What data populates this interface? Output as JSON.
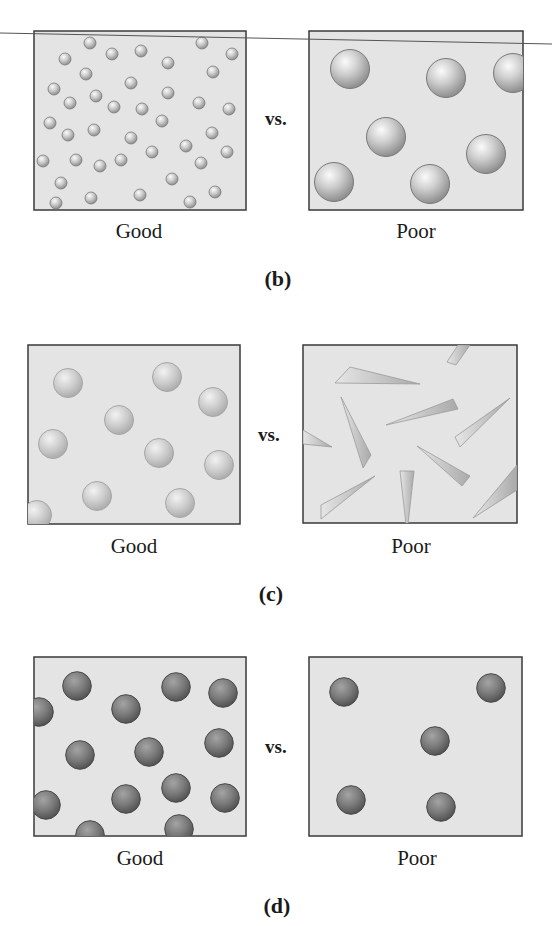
{
  "figure": {
    "colors": {
      "box_fill": "#e4e4e4",
      "box_border": "#3a3a3a",
      "text": "#1a1a1a",
      "line": "#555555"
    },
    "panels": [
      {
        "label": "(b)",
        "vs": "vs.",
        "good": {
          "caption": "Good",
          "particle": "small-sphere",
          "sphere_style": "mid",
          "radius": 6,
          "centers": [
            [
              90,
              43
            ],
            [
              202,
              43
            ],
            [
              65,
              59
            ],
            [
              112,
              54
            ],
            [
              141,
              51
            ],
            [
              232,
              54
            ],
            [
              168,
              63
            ],
            [
              86,
              74
            ],
            [
              213,
              72
            ],
            [
              131,
              83
            ],
            [
              54,
              89
            ],
            [
              168,
              93
            ],
            [
              96,
              96
            ],
            [
              70,
              103
            ],
            [
              114,
              107
            ],
            [
              142,
              109
            ],
            [
              199,
              103
            ],
            [
              229,
              109
            ],
            [
              50,
              123
            ],
            [
              162,
              121
            ],
            [
              68,
              135
            ],
            [
              94,
              130
            ],
            [
              131,
              138
            ],
            [
              212,
              133
            ],
            [
              186,
              146
            ],
            [
              152,
              152
            ],
            [
              227,
              152
            ],
            [
              43,
              161
            ],
            [
              76,
              160
            ],
            [
              100,
              166
            ],
            [
              121,
              160
            ],
            [
              201,
              163
            ],
            [
              61,
              183
            ],
            [
              172,
              179
            ],
            [
              91,
              198
            ],
            [
              140,
              195
            ],
            [
              215,
              192
            ],
            [
              56,
              203
            ],
            [
              190,
              202
            ]
          ]
        },
        "poor": {
          "caption": "Poor",
          "particle": "large-sphere",
          "sphere_style": "mid",
          "radius": 19.5,
          "centers": [
            [
              350,
              69
            ],
            [
              446,
              78
            ],
            [
              513,
              73
            ],
            [
              386,
              137
            ],
            [
              486,
              154
            ],
            [
              334,
              182
            ],
            [
              430,
              184
            ]
          ]
        }
      },
      {
        "label": "(c)",
        "vs": "vs.",
        "good": {
          "caption": "Good",
          "particle": "sphere",
          "sphere_style": "light",
          "radius": 14.5,
          "centers": [
            [
              68,
              383
            ],
            [
              167,
              377
            ],
            [
              213,
              402
            ],
            [
              119,
              420
            ],
            [
              53,
              444
            ],
            [
              159,
              453
            ],
            [
              219,
              465
            ],
            [
              97,
              496
            ],
            [
              180,
              503
            ],
            [
              37,
              515
            ]
          ]
        },
        "poor": {
          "caption": "Poor",
          "particle": "shard"
        }
      },
      {
        "label": "(d)",
        "vs": "vs.",
        "good": {
          "caption": "Good",
          "particle": "sphere",
          "sphere_style": "dark",
          "radius": 14.3,
          "centers": [
            [
              77,
              686
            ],
            [
              176,
              687
            ],
            [
              223,
              693
            ],
            [
              39,
              712
            ],
            [
              126,
              709
            ],
            [
              80,
              755
            ],
            [
              149,
              752
            ],
            [
              219,
              743
            ],
            [
              46,
              805
            ],
            [
              126,
              799
            ],
            [
              176,
              788
            ],
            [
              225,
              798
            ],
            [
              90,
              835
            ],
            [
              179,
              829
            ]
          ]
        },
        "poor": {
          "caption": "Poor",
          "particle": "sphere",
          "sphere_style": "dark",
          "radius": 14.3,
          "centers": [
            [
              344,
              692
            ],
            [
              491,
              688
            ],
            [
              435,
              741
            ],
            [
              351,
              800
            ],
            [
              441,
              807
            ]
          ]
        }
      }
    ]
  }
}
